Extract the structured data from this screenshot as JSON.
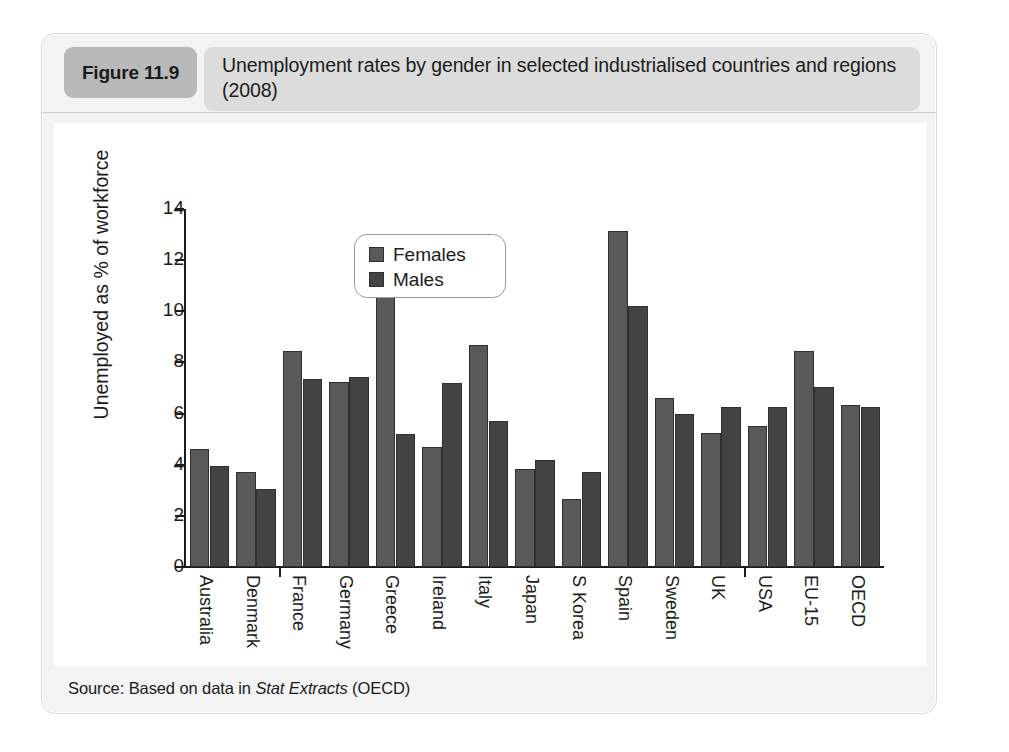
{
  "figure": {
    "badge_label": "Figure 11.9",
    "title": "Unemployment rates by gender in selected industrialised countries and regions (2008)",
    "source_prefix": "Source: Based on data in ",
    "source_italic": "Stat Extracts",
    "source_suffix": " (OECD)"
  },
  "colors": {
    "female_bar": "#595959",
    "male_bar": "#434343",
    "badge_bg": "#b9b9b9",
    "title_bg": "#dcdcdc",
    "panel_bg": "#f3f3f3",
    "canvas_bg": "#ffffff",
    "axis": "#1b1b1b"
  },
  "chart_data": {
    "type": "bar",
    "title": "Unemployment rates by gender in selected industrialised countries and regions (2008)",
    "xlabel": "",
    "ylabel": "Unemployed as % of workforce",
    "ylim": [
      0,
      14
    ],
    "yticks": [
      0,
      2,
      4,
      6,
      8,
      10,
      12,
      14
    ],
    "ytick_labels": [
      "0",
      "2",
      "4",
      "6",
      "8",
      "10",
      "12",
      "14"
    ],
    "grid": false,
    "legend_position": "upper-center",
    "categories": [
      "Australia",
      "Denmark",
      "France",
      "Germany",
      "Greece",
      "Ireland",
      "Italy",
      "Japan",
      "S Korea",
      "Spain",
      "Sweden",
      "UK",
      "USA",
      "EU-15",
      "OECD"
    ],
    "series": [
      {
        "name": "Females",
        "color": "#595959",
        "values": [
          4.6,
          3.7,
          8.45,
          7.25,
          11.6,
          4.7,
          8.7,
          3.85,
          2.65,
          13.15,
          6.6,
          5.25,
          5.5,
          8.45,
          6.35
        ]
      },
      {
        "name": "Males",
        "color": "#434343",
        "values": [
          3.95,
          3.05,
          7.35,
          7.45,
          5.2,
          7.2,
          5.7,
          4.2,
          3.7,
          10.2,
          6.0,
          6.25,
          6.25,
          7.05,
          6.25
        ]
      }
    ]
  }
}
